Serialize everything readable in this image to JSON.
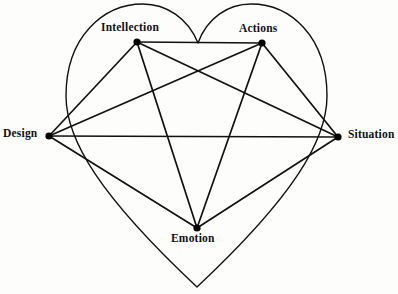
{
  "figure": {
    "kind": "heart-shaped-network-diagram",
    "background_color": "#fdfdfc",
    "stroke_color": "#111111",
    "node_color": "#000000",
    "width": 398,
    "height": 294
  },
  "nodes": [
    {
      "id": "intellection",
      "label": "Intellection",
      "x": 137,
      "y": 42,
      "label_position": "above"
    },
    {
      "id": "actions",
      "label": "Actions",
      "x": 262,
      "y": 43,
      "label_position": "above"
    },
    {
      "id": "design",
      "label": "Design",
      "x": 49,
      "y": 136,
      "label_position": "left"
    },
    {
      "id": "situation",
      "label": "Situation",
      "x": 338,
      "y": 137,
      "label_position": "right"
    },
    {
      "id": "emotion",
      "label": "Emotion",
      "x": 197,
      "y": 228,
      "label_position": "below"
    }
  ],
  "edges": [
    {
      "from": "intellection",
      "to": "actions"
    },
    {
      "from": "intellection",
      "to": "design"
    },
    {
      "from": "intellection",
      "to": "situation"
    },
    {
      "from": "intellection",
      "to": "emotion"
    },
    {
      "from": "actions",
      "to": "design"
    },
    {
      "from": "actions",
      "to": "situation"
    },
    {
      "from": "actions",
      "to": "emotion"
    },
    {
      "from": "design",
      "to": "situation"
    },
    {
      "from": "design",
      "to": "emotion"
    },
    {
      "from": "situation",
      "to": "emotion"
    }
  ],
  "heart_outline": {
    "present": true,
    "top_cleft": {
      "x": 198,
      "y": 43
    },
    "bottom_tip": {
      "x": 197,
      "y": 287
    },
    "left_extreme": {
      "x": 66,
      "y": 112
    },
    "right_extreme": {
      "x": 327,
      "y": 112
    }
  }
}
